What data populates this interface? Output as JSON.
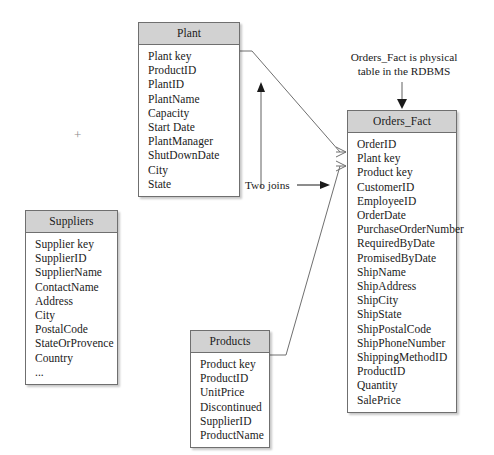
{
  "diagram": {
    "background_color": "#ffffff",
    "header_fill": "#d2d2d2",
    "border_color": "#6f6f6f",
    "text_color": "#1a1a1a"
  },
  "entities": {
    "plant": {
      "name": "Plant",
      "fields": [
        "Plant key",
        "ProductID",
        "PlantID",
        "PlantName",
        "Capacity",
        "Start Date",
        "PlantManager",
        "ShutDownDate",
        "City",
        "State"
      ]
    },
    "suppliers": {
      "name": "Suppliers",
      "fields": [
        "Supplier key",
        "SupplierID",
        "SupplierName",
        "ContactName",
        "Address",
        "City",
        "PostalCode",
        "StateOrProvence",
        "Country",
        "..."
      ]
    },
    "products": {
      "name": "Products",
      "fields": [
        "Product key",
        "ProductID",
        "UnitPrice",
        "Discontinued",
        "SupplierID",
        "ProductName"
      ]
    },
    "orders_fact": {
      "name": "Orders_Fact",
      "fields": [
        "OrderID",
        "Plant key",
        "Product key",
        "CustomerID",
        "EmployeeID",
        "OrderDate",
        "PurchaseOrderNumber",
        "RequiredByDate",
        "PromisedByDate",
        "ShipName",
        "ShipAddress",
        "ShipCity",
        "ShipState",
        "ShipPostalCode",
        "ShipPhoneNumber",
        "ShippingMethodID",
        "ProductID",
        "Quantity",
        "SalePrice"
      ]
    }
  },
  "annotations": {
    "rdbms_note_line1": "Orders_Fact is physical",
    "rdbms_note_line2": "table in the RDBMS",
    "two_joins_label": "Two joins",
    "plus_mark": "+"
  }
}
